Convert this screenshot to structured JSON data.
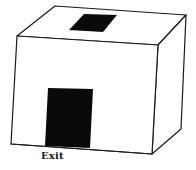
{
  "diagram": {
    "colors": {
      "line": "#1a1a1a",
      "fill_dark": "#0a0a0a",
      "background": "#ffffff"
    },
    "labels": {
      "exit": "Exit"
    },
    "elements": [
      {
        "name": "box",
        "kind": "3d-rectangular-prism"
      },
      {
        "name": "roof-opening",
        "kind": "dark-parallelogram",
        "location": "top face, center"
      },
      {
        "name": "exit-door",
        "kind": "dark-rectangle",
        "location": "front face, lower left-center"
      }
    ]
  }
}
